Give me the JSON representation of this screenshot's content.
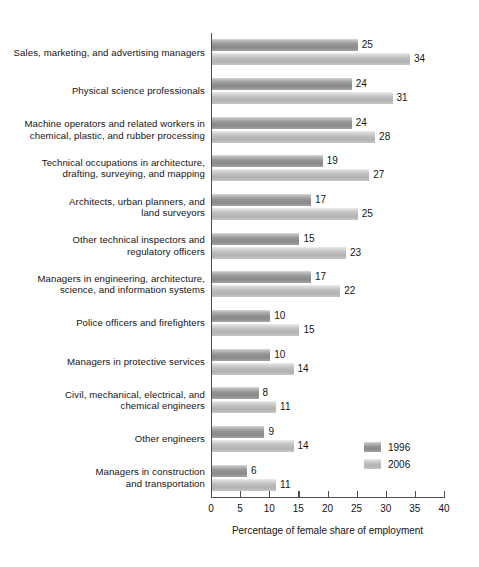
{
  "chart_data": {
    "type": "bar",
    "orientation": "horizontal",
    "title": "",
    "xlabel": "Percentage of female share of employment",
    "ylabel": "",
    "xlim": [
      0,
      40
    ],
    "xticks": [
      0,
      5,
      10,
      15,
      20,
      25,
      30,
      35,
      40
    ],
    "grid": false,
    "legend_position": "bottom-right",
    "categories": [
      "Sales, marketing, and advertising managers",
      "Physical science professionals",
      "Machine operators and related workers in\nchemical, plastic, and rubber processing",
      "Technical occupations in architecture,\ndrafting, surveying, and mapping",
      "Architects, urban planners, and\nland surveyors",
      "Other technical inspectors and\nregulatory officers",
      "Managers in engineering, architecture,\nscience, and information systems",
      "Police officers and firefighters",
      "Managers in protective services",
      "Civil, mechanical, electrical, and\nchemical engineers",
      "Other engineers",
      "Managers in construction\nand transportation"
    ],
    "series": [
      {
        "name": "1996",
        "color": "#949494",
        "values": [
          25,
          24,
          24,
          19,
          17,
          15,
          17,
          10,
          10,
          8,
          9,
          6
        ]
      },
      {
        "name": "2006",
        "color": "#bdbdbd",
        "values": [
          34,
          31,
          28,
          27,
          25,
          23,
          22,
          15,
          14,
          11,
          14,
          11
        ]
      }
    ]
  },
  "legend": {
    "entries": [
      {
        "label": "1996"
      },
      {
        "label": "2006"
      }
    ]
  }
}
